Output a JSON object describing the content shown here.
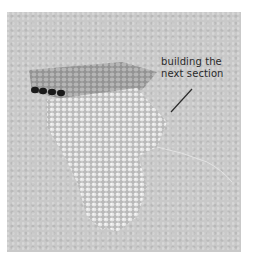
{
  "photo": {
    "subject": "beadwork-in-progress",
    "background_color": "#c9c9c9"
  },
  "annotation": {
    "line1": "building the",
    "line2": "next section",
    "leader_color": "#2a2a2a"
  }
}
